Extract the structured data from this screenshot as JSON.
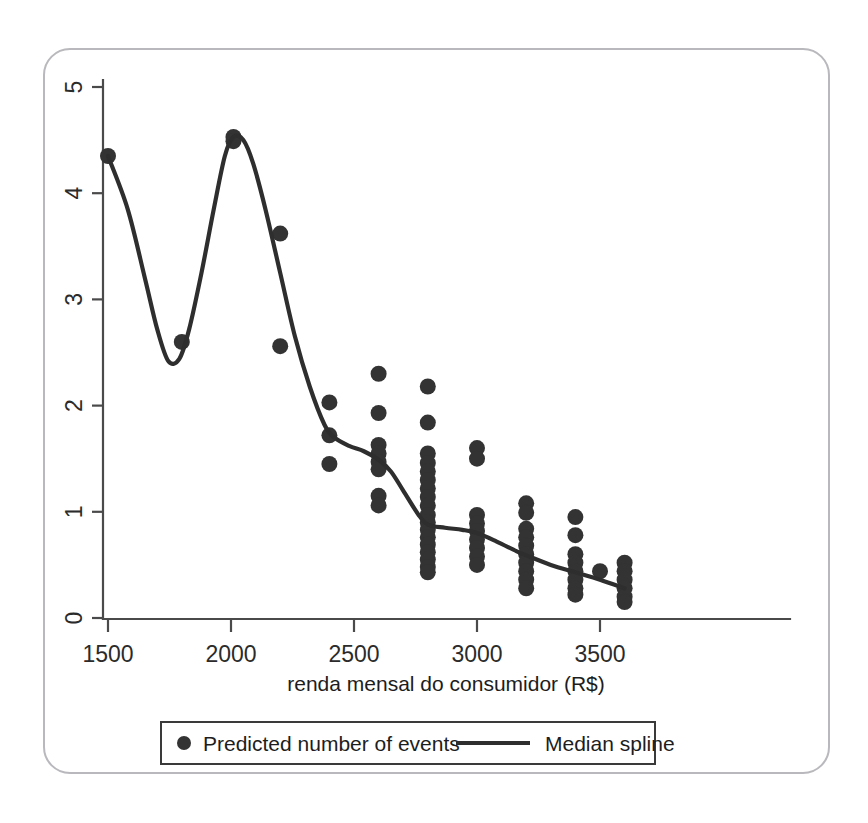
{
  "chart_data": {
    "type": "scatter",
    "title": "",
    "xlabel": "renda mensal do consumidor (R$)",
    "ylabel": "",
    "xlim": [
      1440,
      3640
    ],
    "ylim": [
      0,
      5.3
    ],
    "xticks": [
      1500,
      2000,
      2500,
      3000,
      3500
    ],
    "yticks": [
      0,
      1,
      2,
      3,
      4,
      5
    ],
    "xtick_labels": [
      "1500",
      "2000",
      "2500",
      "3000",
      "3500"
    ],
    "ytick_labels": [
      "0",
      "1",
      "2",
      "3",
      "4",
      "5"
    ],
    "grid": false,
    "legend_position": "below-axis",
    "series": [
      {
        "name": "Predicted number of events",
        "marker": "circle",
        "color": "#333333",
        "points": [
          {
            "x": 1500,
            "y": 4.35
          },
          {
            "x": 1800,
            "y": 2.6
          },
          {
            "x": 2010,
            "y": 4.53
          },
          {
            "x": 2010,
            "y": 4.49
          },
          {
            "x": 2200,
            "y": 3.62
          },
          {
            "x": 2200,
            "y": 2.56
          },
          {
            "x": 2400,
            "y": 2.03
          },
          {
            "x": 2400,
            "y": 1.72
          },
          {
            "x": 2400,
            "y": 1.45
          },
          {
            "x": 2600,
            "y": 2.3
          },
          {
            "x": 2600,
            "y": 1.93
          },
          {
            "x": 2600,
            "y": 1.63
          },
          {
            "x": 2600,
            "y": 1.55
          },
          {
            "x": 2600,
            "y": 1.47
          },
          {
            "x": 2600,
            "y": 1.4
          },
          {
            "x": 2600,
            "y": 1.15
          },
          {
            "x": 2600,
            "y": 1.06
          },
          {
            "x": 2800,
            "y": 2.18
          },
          {
            "x": 2800,
            "y": 1.84
          },
          {
            "x": 2800,
            "y": 1.55
          },
          {
            "x": 2800,
            "y": 1.46
          },
          {
            "x": 2800,
            "y": 1.38
          },
          {
            "x": 2800,
            "y": 1.3
          },
          {
            "x": 2800,
            "y": 1.22
          },
          {
            "x": 2800,
            "y": 1.14
          },
          {
            "x": 2800,
            "y": 1.06
          },
          {
            "x": 2800,
            "y": 0.97
          },
          {
            "x": 2800,
            "y": 0.9
          },
          {
            "x": 2800,
            "y": 0.83
          },
          {
            "x": 2800,
            "y": 0.76
          },
          {
            "x": 2800,
            "y": 0.69
          },
          {
            "x": 2800,
            "y": 0.62
          },
          {
            "x": 2800,
            "y": 0.55
          },
          {
            "x": 2800,
            "y": 0.48
          },
          {
            "x": 2800,
            "y": 0.43
          },
          {
            "x": 3000,
            "y": 1.6
          },
          {
            "x": 3000,
            "y": 1.5
          },
          {
            "x": 3000,
            "y": 0.97
          },
          {
            "x": 3000,
            "y": 0.89
          },
          {
            "x": 3000,
            "y": 0.82
          },
          {
            "x": 3000,
            "y": 0.74
          },
          {
            "x": 3000,
            "y": 0.66
          },
          {
            "x": 3000,
            "y": 0.58
          },
          {
            "x": 3000,
            "y": 0.5
          },
          {
            "x": 3200,
            "y": 1.08
          },
          {
            "x": 3200,
            "y": 0.99
          },
          {
            "x": 3200,
            "y": 0.84
          },
          {
            "x": 3200,
            "y": 0.76
          },
          {
            "x": 3200,
            "y": 0.68
          },
          {
            "x": 3200,
            "y": 0.6
          },
          {
            "x": 3200,
            "y": 0.52
          },
          {
            "x": 3200,
            "y": 0.44
          },
          {
            "x": 3200,
            "y": 0.36
          },
          {
            "x": 3200,
            "y": 0.28
          },
          {
            "x": 3400,
            "y": 0.95
          },
          {
            "x": 3400,
            "y": 0.78
          },
          {
            "x": 3400,
            "y": 0.6
          },
          {
            "x": 3400,
            "y": 0.52
          },
          {
            "x": 3400,
            "y": 0.44
          },
          {
            "x": 3400,
            "y": 0.36
          },
          {
            "x": 3400,
            "y": 0.28
          },
          {
            "x": 3400,
            "y": 0.22
          },
          {
            "x": 3500,
            "y": 0.44
          },
          {
            "x": 3600,
            "y": 0.52
          },
          {
            "x": 3600,
            "y": 0.44
          },
          {
            "x": 3600,
            "y": 0.36
          },
          {
            "x": 3600,
            "y": 0.28
          },
          {
            "x": 3600,
            "y": 0.2
          },
          {
            "x": 3600,
            "y": 0.15
          }
        ]
      },
      {
        "name": "Median spline",
        "marker": "line",
        "color": "#2e2e2e",
        "points": [
          {
            "x": 1500,
            "y": 4.35
          },
          {
            "x": 1580,
            "y": 3.85
          },
          {
            "x": 1650,
            "y": 3.2
          },
          {
            "x": 1700,
            "y": 2.72
          },
          {
            "x": 1745,
            "y": 2.42
          },
          {
            "x": 1790,
            "y": 2.44
          },
          {
            "x": 1830,
            "y": 2.72
          },
          {
            "x": 1880,
            "y": 3.25
          },
          {
            "x": 1930,
            "y": 3.85
          },
          {
            "x": 1975,
            "y": 4.35
          },
          {
            "x": 2010,
            "y": 4.53
          },
          {
            "x": 2050,
            "y": 4.5
          },
          {
            "x": 2090,
            "y": 4.28
          },
          {
            "x": 2140,
            "y": 3.85
          },
          {
            "x": 2200,
            "y": 3.25
          },
          {
            "x": 2260,
            "y": 2.65
          },
          {
            "x": 2320,
            "y": 2.18
          },
          {
            "x": 2380,
            "y": 1.82
          },
          {
            "x": 2420,
            "y": 1.7
          },
          {
            "x": 2480,
            "y": 1.62
          },
          {
            "x": 2540,
            "y": 1.57
          },
          {
            "x": 2600,
            "y": 1.49
          },
          {
            "x": 2650,
            "y": 1.38
          },
          {
            "x": 2700,
            "y": 1.2
          },
          {
            "x": 2760,
            "y": 0.98
          },
          {
            "x": 2800,
            "y": 0.88
          },
          {
            "x": 2870,
            "y": 0.85
          },
          {
            "x": 2940,
            "y": 0.83
          },
          {
            "x": 3000,
            "y": 0.8
          },
          {
            "x": 3080,
            "y": 0.72
          },
          {
            "x": 3160,
            "y": 0.63
          },
          {
            "x": 3200,
            "y": 0.59
          },
          {
            "x": 3300,
            "y": 0.5
          },
          {
            "x": 3400,
            "y": 0.43
          },
          {
            "x": 3500,
            "y": 0.36
          },
          {
            "x": 3600,
            "y": 0.28
          }
        ]
      }
    ]
  },
  "legend": {
    "entries": [
      {
        "label": "Predicted number of events",
        "marker": "dot"
      },
      {
        "label": "Median spline",
        "marker": "line"
      }
    ]
  },
  "axis": {
    "x_title": "renda mensal do consumidor (R$)"
  },
  "colors": {
    "marker": "#333333",
    "spline": "#2e2e2e",
    "axis": "#4a4a4a",
    "frame": "#b9b9bd",
    "legend_border": "#3a3a3a",
    "background": "#ffffff"
  }
}
